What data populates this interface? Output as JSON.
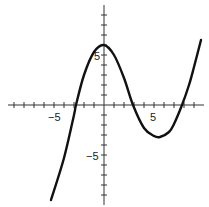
{
  "chart_data": {
    "type": "line",
    "title": "",
    "xlabel": "",
    "ylabel": "",
    "xlim": [
      -10,
      10
    ],
    "ylim": [
      -10,
      10
    ],
    "grid": false,
    "tick_labels": {
      "x": [
        "-5",
        "5"
      ],
      "y": [
        "5",
        "-5"
      ]
    },
    "series": [
      {
        "name": "f(x)",
        "x": [
          -5.3,
          -4,
          -3,
          -2.8,
          -2,
          -1,
          0,
          1,
          2,
          2.9,
          4,
          5,
          5.6,
          6.5,
          7,
          7.8,
          8.5,
          9,
          9.7
        ],
        "y": [
          -9.5,
          -5.3,
          -1.0,
          0,
          3.0,
          5.3,
          6.0,
          5.0,
          2.7,
          0,
          -2.3,
          -3.1,
          -3.2,
          -2.7,
          -1.9,
          0,
          2.0,
          3.8,
          6.5
        ]
      }
    ]
  }
}
